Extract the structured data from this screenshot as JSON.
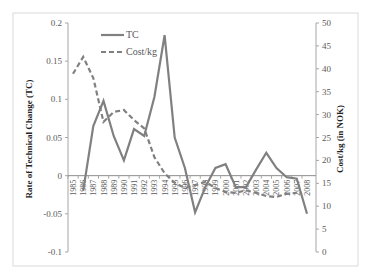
{
  "chart_data": {
    "type": "line",
    "title": "",
    "xlabel": "",
    "ylabel": "Rate of Technical Change (TC)",
    "y2label": "Cost/kg (in NOK)",
    "ylim": [
      -0.1,
      0.2
    ],
    "y2lim": [
      0,
      50
    ],
    "yticks": [
      "0.2",
      "0.15",
      "0.1",
      "0.05",
      "0",
      "-0.05",
      "-0.1"
    ],
    "y2ticks": [
      "50",
      "45",
      "40",
      "35",
      "30",
      "25",
      "20",
      "15",
      "10",
      "5",
      "0"
    ],
    "categories": [
      "1985",
      "1986",
      "1987",
      "1988",
      "1989",
      "1990",
      "1991",
      "1992",
      "1993",
      "1994",
      "1995",
      "1996",
      "1997",
      "1998",
      "1999",
      "2000",
      "2001",
      "2002",
      "2003",
      "2004",
      "2005",
      "2006",
      "2007",
      "2008"
    ],
    "legend_position": "top-left inside",
    "grid": false,
    "series": [
      {
        "name": "TC",
        "axis": "left",
        "style": "solid",
        "color": "#808080",
        "values": [
          null,
          -0.02,
          0.065,
          0.098,
          0.052,
          0.02,
          0.061,
          0.052,
          0.103,
          0.184,
          0.05,
          0.01,
          -0.048,
          -0.015,
          0.01,
          0.015,
          -0.015,
          -0.015,
          0.008,
          0.03,
          0.01,
          -0.002,
          -0.004,
          -0.05
        ]
      },
      {
        "name": "Cost/kg",
        "axis": "right",
        "style": "dashed",
        "color": "#808080",
        "values": [
          38.9,
          42.6,
          38,
          28.4,
          30.6,
          31,
          28.8,
          27,
          20.7,
          17.2,
          15.1,
          14,
          14.6,
          15.3,
          14,
          13.1,
          12.9,
          13.5,
          12.9,
          12.2,
          12,
          12.7,
          12.9,
          null
        ]
      }
    ]
  },
  "legend": {
    "tc": "TC",
    "cost": "Cost/kg"
  },
  "axes": {
    "left_title": "Rate of Technical Change (TC)",
    "right_title": "Cost/kg (in NOK)"
  }
}
